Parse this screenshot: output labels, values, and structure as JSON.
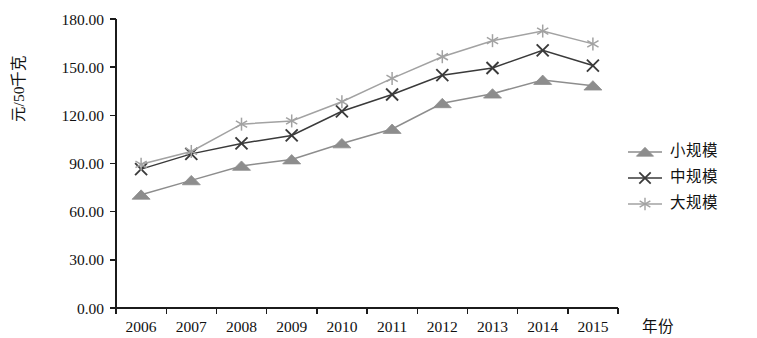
{
  "chart_data": {
    "type": "line",
    "title": "",
    "xlabel": "年份",
    "ylabel": "元/50千克",
    "categories": [
      "2006",
      "2007",
      "2008",
      "2009",
      "2010",
      "2011",
      "2012",
      "2013",
      "2014",
      "2015"
    ],
    "x_tick_labels": [
      "2006",
      "2007",
      "2008",
      "2009",
      "2010",
      "2011",
      "2012",
      "2013",
      "2014",
      "2015"
    ],
    "y_tick_labels": [
      "0.00",
      "30.00",
      "60.00",
      "90.00",
      "120.00",
      "150.00",
      "180.00"
    ],
    "y_ticks": [
      0,
      30,
      60,
      90,
      120,
      150,
      180
    ],
    "ylim": [
      0,
      180
    ],
    "grid": false,
    "legend_position": "right",
    "series": [
      {
        "name": "小规模",
        "marker": "triangle",
        "color": "#8d8d8d",
        "values": [
          70.5,
          79.5,
          88.5,
          92.5,
          102.5,
          111.5,
          127.5,
          133.5,
          142.0,
          138.5
        ]
      },
      {
        "name": "中规模",
        "marker": "x",
        "color": "#3a3a3a",
        "values": [
          86.5,
          96.0,
          102.5,
          107.5,
          122.5,
          133.0,
          145.0,
          149.5,
          160.5,
          151.0
        ]
      },
      {
        "name": "大规模",
        "marker": "asterisk",
        "color": "#a2a2a2",
        "values": [
          89.5,
          97.5,
          114.5,
          116.5,
          128.5,
          143.0,
          156.5,
          166.5,
          172.5,
          164.5
        ]
      }
    ]
  },
  "layout": {
    "plot_left": 116,
    "plot_right": 618,
    "plot_top": 19,
    "plot_bottom": 308,
    "legend_x": 628,
    "legend_y_start": 152,
    "legend_row_height": 26
  }
}
